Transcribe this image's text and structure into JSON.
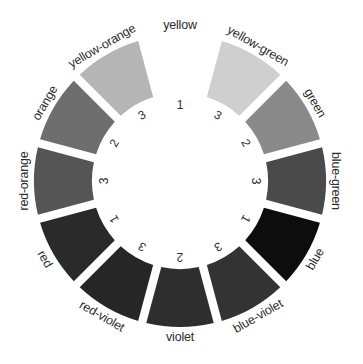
{
  "diagram": {
    "type": "color-wheel",
    "segments": [
      {
        "name": "yellow",
        "number": "1",
        "fill": "#ffffff",
        "empty": true
      },
      {
        "name": "yellow-green",
        "number": "3",
        "fill": "#cfcfcf"
      },
      {
        "name": "green",
        "number": "2",
        "fill": "#8a8a8a"
      },
      {
        "name": "blue-green",
        "number": "3",
        "fill": "#4a4a4a"
      },
      {
        "name": "blue",
        "number": "1",
        "fill": "#0d0d0d"
      },
      {
        "name": "blue-violet",
        "number": "3",
        "fill": "#333333"
      },
      {
        "name": "violet",
        "number": "2",
        "fill": "#2e2e2e"
      },
      {
        "name": "red-violet",
        "number": "3",
        "fill": "#262626"
      },
      {
        "name": "red",
        "number": "1",
        "fill": "#2a2a2a"
      },
      {
        "name": "red-orange",
        "number": "3",
        "fill": "#555555"
      },
      {
        "name": "orange",
        "number": "2",
        "fill": "#6e6e6e"
      },
      {
        "name": "yellow-orange",
        "number": "3",
        "fill": "#b5b5b5"
      }
    ]
  }
}
